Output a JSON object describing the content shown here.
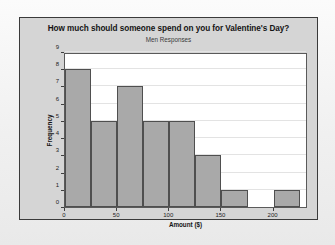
{
  "chart_data": {
    "type": "bar",
    "title": "How much should someone spend on you for Valentine's Day?",
    "subtitle": "Men Responses",
    "xlabel": "Amount ($)",
    "ylabel": "Frequency",
    "grid": true,
    "legend": "none",
    "bin_width": 25,
    "bin_starts": [
      0,
      25,
      50,
      75,
      100,
      125,
      150,
      175,
      200
    ],
    "categories": [
      "0-25",
      "25-50",
      "50-75",
      "75-100",
      "100-125",
      "125-150",
      "150-175",
      "175-200",
      "200-225"
    ],
    "values": [
      8,
      5,
      7,
      5,
      5,
      3,
      1,
      0,
      1
    ],
    "xlim": [
      0,
      233
    ],
    "ylim": [
      0,
      9
    ],
    "x_ticks": [
      0,
      50,
      100,
      150,
      200
    ],
    "x_tick_labels": [
      "0",
      "50",
      "100",
      "150",
      "200"
    ],
    "y_ticks": [
      0,
      1,
      2,
      3,
      4,
      5,
      6,
      7,
      8,
      9
    ],
    "y_tick_labels": [
      "0",
      "1",
      "2",
      "3",
      "4",
      "5",
      "6",
      "7",
      "8",
      "9"
    ],
    "colors": {
      "bar_fill": "#a9a9a9",
      "bar_edge": "#4f4f4f",
      "panel_bg": "#d5d5d5",
      "plot_bg": "#ffffff",
      "grid": "#e3e3e3",
      "text": "#141414",
      "page_bg": "#f2f2f2"
    }
  }
}
